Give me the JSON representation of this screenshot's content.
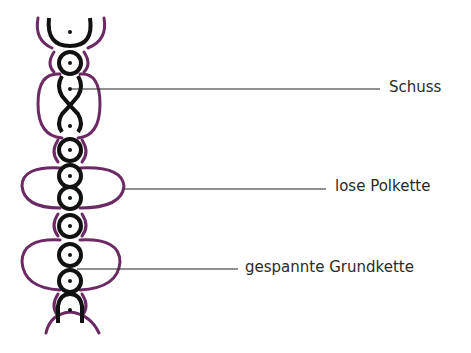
{
  "diagram": {
    "type": "weave-cross-section",
    "colors": {
      "weft_and_ground_warp": "#111111",
      "pile_warp": "#6b2a63",
      "leader_line": "#222222",
      "label_text": "#2a2a2a",
      "background": "#ffffff"
    },
    "labels": [
      {
        "id": "schuss",
        "text": "Schuss"
      },
      {
        "id": "lose_polkette",
        "text": "lose Polkette"
      },
      {
        "id": "gespannte_grundkette",
        "text": "gespannte Grundkette"
      }
    ]
  }
}
